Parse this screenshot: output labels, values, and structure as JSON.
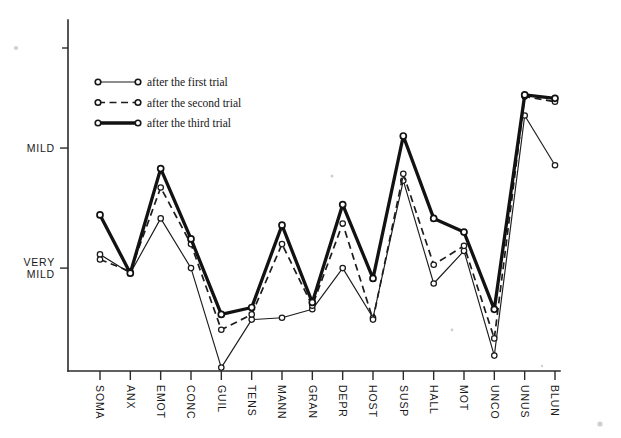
{
  "figure": {
    "background": "#ffffff",
    "ink_color": "#1a1a1a"
  },
  "legend": {
    "position": "top-left",
    "entries": [
      {
        "label": "after the first trial",
        "style": "thin-solid",
        "marker": "open-circle"
      },
      {
        "label": "after the second trial",
        "style": "dashed",
        "marker": "open-circle"
      },
      {
        "label": "after the third trial",
        "style": "thick-solid",
        "marker": "open-circle"
      }
    ]
  },
  "axes": {
    "y_ticks": [
      "MILD",
      "VERY\nMILD"
    ],
    "y_tick_labels": [
      {
        "text": "MILD",
        "lines": [
          "MILD"
        ]
      },
      {
        "text": "VERY MILD",
        "lines": [
          "VERY",
          "MILD"
        ]
      }
    ],
    "x_tick_labels": [
      "SOMA",
      "ANX",
      "EMOT",
      "CONC",
      "GUIL",
      "TENS",
      "MANN",
      "GRAN",
      "DEPR",
      "HOST",
      "SUSP",
      "HALL",
      "MOT",
      "UNCO",
      "UNUS",
      "BLUN"
    ],
    "x_label_rotation": -90,
    "grid": false
  },
  "chart_data": {
    "type": "line",
    "title": "",
    "xlabel": "",
    "ylabel": "",
    "grid": false,
    "legend_position": "top-left",
    "ylim": [
      0,
      10
    ],
    "ytick_values": [
      6.5,
      3.0
    ],
    "ytick_text": [
      "MILD",
      "VERY MILD"
    ],
    "categories": [
      "SOMA",
      "ANX",
      "EMOT",
      "CONC",
      "GUIL",
      "TENS",
      "MANN",
      "GRAN",
      "DEPR",
      "HOST",
      "SUSP",
      "HALL",
      "MOT",
      "UNCO",
      "UNUS",
      "BLUN"
    ],
    "series": [
      {
        "name": "after the first trial",
        "style": "thin-solid",
        "marker": "open-circle",
        "values": [
          3.4,
          2.85,
          4.45,
          3.0,
          0.1,
          1.5,
          1.55,
          1.8,
          3.0,
          1.55,
          5.55,
          2.55,
          3.5,
          0.45,
          7.45,
          6.0
        ]
      },
      {
        "name": "after the second trial",
        "style": "dashed",
        "marker": "open-circle",
        "values": [
          3.25,
          2.9,
          5.35,
          3.7,
          1.2,
          1.65,
          3.7,
          1.9,
          4.3,
          1.5,
          5.75,
          3.1,
          3.65,
          0.95,
          8.0,
          7.85
        ]
      },
      {
        "name": "after the third trial",
        "style": "thick-solid",
        "marker": "open-circle",
        "values": [
          4.55,
          2.85,
          5.9,
          3.85,
          1.65,
          1.85,
          4.25,
          2.0,
          4.85,
          2.7,
          6.85,
          4.45,
          4.05,
          1.8,
          8.05,
          7.95
        ]
      }
    ]
  }
}
